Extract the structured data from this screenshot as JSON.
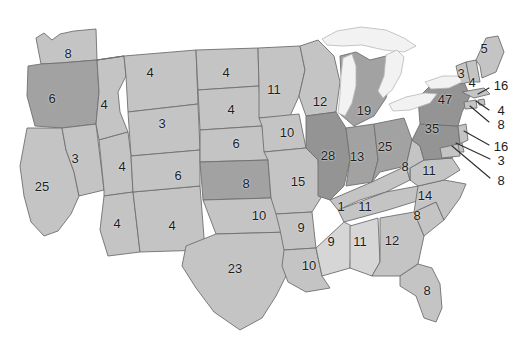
{
  "map": {
    "title": "United States state value map",
    "palette": {
      "tier_light": "#d6d6d6",
      "tier_mid_light": "#c4c4c4",
      "tier_mid": "#b4b4b4",
      "tier_dark": "#a2a2a2",
      "tier_darkest": "#949494",
      "lake": "#f2f2f2",
      "border": "#6f6f6f",
      "background": "#ffffff",
      "label": "#1d1d1d"
    },
    "states": [
      {
        "code": "WA",
        "name": "Washington",
        "value": "8",
        "x": 68,
        "y": 53,
        "tier": "tier_mid_light",
        "inset": false
      },
      {
        "code": "OR",
        "name": "Oregon",
        "value": "6",
        "x": 52,
        "y": 98,
        "tier": "tier_dark",
        "inset": false
      },
      {
        "code": "CA",
        "name": "California",
        "value": "25",
        "x": 42,
        "y": 186,
        "tier": "tier_mid_light",
        "inset": false
      },
      {
        "code": "NV",
        "name": "Nevada",
        "value": "3",
        "x": 75,
        "y": 158,
        "tier": "tier_mid_light",
        "inset": false
      },
      {
        "code": "ID",
        "name": "Idaho",
        "value": "4",
        "x": 104,
        "y": 104,
        "tier": "tier_mid_light",
        "inset": false
      },
      {
        "code": "MT",
        "name": "Montana",
        "value": "4",
        "x": 150,
        "y": 72,
        "tier": "tier_mid_light",
        "inset": false
      },
      {
        "code": "WY",
        "name": "Wyoming",
        "value": "3",
        "x": 162,
        "y": 123,
        "tier": "tier_mid_light",
        "inset": false
      },
      {
        "code": "UT",
        "name": "Utah",
        "value": "4",
        "x": 122,
        "y": 166,
        "tier": "tier_mid_light",
        "inset": false
      },
      {
        "code": "AZ",
        "name": "Arizona",
        "value": "4",
        "x": 117,
        "y": 223,
        "tier": "tier_mid_light",
        "inset": false
      },
      {
        "code": "NM",
        "name": "New Mexico",
        "value": "4",
        "x": 172,
        "y": 225,
        "tier": "tier_mid_light",
        "inset": false
      },
      {
        "code": "CO",
        "name": "Colorado",
        "value": "6",
        "x": 178,
        "y": 175,
        "tier": "tier_mid_light",
        "inset": false
      },
      {
        "code": "ND",
        "name": "North Dakota",
        "value": "4",
        "x": 226,
        "y": 72,
        "tier": "tier_mid_light",
        "inset": false
      },
      {
        "code": "SD",
        "name": "South Dakota",
        "value": "4",
        "x": 231,
        "y": 109,
        "tier": "tier_mid_light",
        "inset": false
      },
      {
        "code": "NE",
        "name": "Nebraska",
        "value": "6",
        "x": 236,
        "y": 143,
        "tier": "tier_mid_light",
        "inset": false
      },
      {
        "code": "KS",
        "name": "Kansas",
        "value": "8",
        "x": 246,
        "y": 183,
        "tier": "tier_dark",
        "inset": false
      },
      {
        "code": "OK",
        "name": "Oklahoma",
        "value": "10",
        "x": 259,
        "y": 215,
        "tier": "tier_mid_light",
        "inset": false
      },
      {
        "code": "TX",
        "name": "Texas",
        "value": "23",
        "x": 235,
        "y": 268,
        "tier": "tier_mid_light",
        "inset": false
      },
      {
        "code": "MN",
        "name": "Minnesota",
        "value": "11",
        "x": 274,
        "y": 89,
        "tier": "tier_mid_light",
        "inset": false
      },
      {
        "code": "IA",
        "name": "Iowa",
        "value": "10",
        "x": 287,
        "y": 132,
        "tier": "tier_mid_light",
        "inset": false
      },
      {
        "code": "MO",
        "name": "Missouri",
        "value": "15",
        "x": 298,
        "y": 181,
        "tier": "tier_mid_light",
        "inset": false
      },
      {
        "code": "AR",
        "name": "Arkansas",
        "value": "9",
        "x": 301,
        "y": 227,
        "tier": "tier_mid_light",
        "inset": false
      },
      {
        "code": "LA",
        "name": "Louisiana",
        "value": "10",
        "x": 309,
        "y": 265,
        "tier": "tier_mid_light",
        "inset": false
      },
      {
        "code": "WI",
        "name": "Wisconsin",
        "value": "12",
        "x": 320,
        "y": 101,
        "tier": "tier_mid_light",
        "inset": false
      },
      {
        "code": "MI",
        "name": "Michigan",
        "value": "19",
        "x": 364,
        "y": 110,
        "tier": "tier_dark",
        "inset": false
      },
      {
        "code": "IL",
        "name": "Illinois",
        "value": "28",
        "x": 328,
        "y": 155,
        "tier": "tier_darkest",
        "inset": false
      },
      {
        "code": "IN",
        "name": "Indiana",
        "value": "13",
        "x": 357,
        "y": 156,
        "tier": "tier_dark",
        "inset": false
      },
      {
        "code": "OH",
        "name": "Ohio",
        "value": "25",
        "x": 385,
        "y": 146,
        "tier": "tier_dark",
        "inset": false
      },
      {
        "code": "KY",
        "name": "Kentucky",
        "value": "1",
        "x": 341,
        "y": 206,
        "tier": "tier_mid_light",
        "inset": false
      },
      {
        "code": "TN",
        "name": "Tennessee",
        "value": "11",
        "x": 365,
        "y": 206,
        "tier": "tier_mid_light",
        "inset": false
      },
      {
        "code": "MS",
        "name": "Mississippi",
        "value": "9",
        "x": 331,
        "y": 241,
        "tier": "tier_light",
        "inset": false
      },
      {
        "code": "AL",
        "name": "Alabama",
        "value": "11",
        "x": 360,
        "y": 241,
        "tier": "tier_light",
        "inset": false
      },
      {
        "code": "GA",
        "name": "Georgia",
        "value": "12",
        "x": 392,
        "y": 240,
        "tier": "tier_mid_light",
        "inset": false
      },
      {
        "code": "FL",
        "name": "Florida",
        "value": "8",
        "x": 427,
        "y": 290,
        "tier": "tier_mid_light",
        "inset": false
      },
      {
        "code": "SC",
        "name": "South Carolina",
        "value": "8",
        "x": 417,
        "y": 215,
        "tier": "tier_mid_light",
        "inset": false
      },
      {
        "code": "NC",
        "name": "North Carolina",
        "value": "14",
        "x": 425,
        "y": 195,
        "tier": "tier_mid_light",
        "inset": false
      },
      {
        "code": "VA",
        "name": "Virginia",
        "value": "11",
        "x": 429,
        "y": 170,
        "tier": "tier_mid_light",
        "inset": false
      },
      {
        "code": "WV",
        "name": "West Virginia",
        "value": "8",
        "x": 405,
        "y": 166,
        "tier": "tier_mid_light",
        "inset": false
      },
      {
        "code": "PA",
        "name": "Pennsylvania",
        "value": "35",
        "x": 432,
        "y": 128,
        "tier": "tier_darkest",
        "inset": false
      },
      {
        "code": "NY",
        "name": "New York",
        "value": "47",
        "x": 445,
        "y": 99,
        "tier": "tier_darkest",
        "inset": false
      },
      {
        "code": "VT",
        "name": "Vermont",
        "value": "3",
        "x": 461,
        "y": 73,
        "tier": "tier_mid_light",
        "inset": false
      },
      {
        "code": "NH",
        "name": "New Hampshire",
        "value": "4",
        "x": 472,
        "y": 82,
        "tier": "tier_mid_light",
        "inset": false
      },
      {
        "code": "ME",
        "name": "Maine",
        "value": "5",
        "x": 484,
        "y": 48,
        "tier": "tier_mid_light",
        "inset": false
      }
    ],
    "callouts": [
      {
        "code": "MA",
        "name": "Massachusetts",
        "value": "16",
        "x": 501,
        "y": 85,
        "line": {
          "x1": 489,
          "y1": 88,
          "x2": 478,
          "y2": 94
        }
      },
      {
        "code": "RI",
        "name": "Rhode Island",
        "value": "4",
        "x": 501,
        "y": 110,
        "line": {
          "x1": 489,
          "y1": 110,
          "x2": 476,
          "y2": 101
        }
      },
      {
        "code": "CT",
        "name": "Connecticut",
        "value": "8",
        "x": 501,
        "y": 124,
        "line": {
          "x1": 489,
          "y1": 122,
          "x2": 470,
          "y2": 106
        }
      },
      {
        "code": "NJ",
        "name": "New Jersey",
        "value": "16",
        "x": 501,
        "y": 146,
        "line": {
          "x1": 489,
          "y1": 145,
          "x2": 464,
          "y2": 131
        }
      },
      {
        "code": "DE",
        "name": "Delaware",
        "value": "3",
        "x": 501,
        "y": 160,
        "line": {
          "x1": 490,
          "y1": 159,
          "x2": 456,
          "y2": 143
        }
      },
      {
        "code": "MD",
        "name": "Maryland",
        "value": "8",
        "x": 501,
        "y": 180,
        "line": {
          "x1": 490,
          "y1": 178,
          "x2": 452,
          "y2": 146
        }
      }
    ]
  }
}
